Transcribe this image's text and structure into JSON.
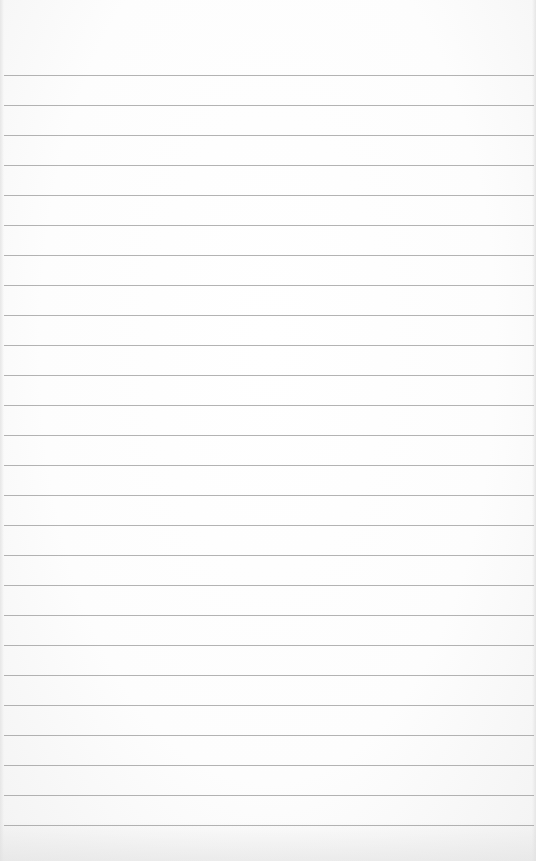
{
  "paper": {
    "kind": "lined-notepad",
    "background_color": "#fbfbfb",
    "rule_color": "#9a9a9a",
    "first_rule_y": 75,
    "rule_spacing": 30,
    "rule_count": 26,
    "text": ""
  }
}
